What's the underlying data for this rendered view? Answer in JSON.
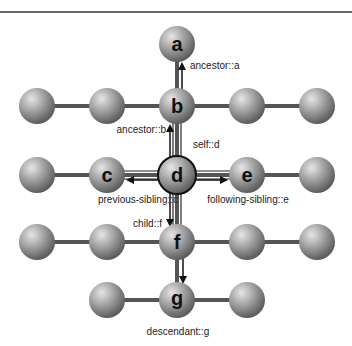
{
  "diagram": {
    "nodes": {
      "a": "a",
      "b": "b",
      "c": "c",
      "d": "d",
      "e": "e",
      "f": "f",
      "g": "g"
    },
    "axis_labels": {
      "ancestor_a": "ancestor::a",
      "ancestor_b": "ancestor::b",
      "self_d": "self::d",
      "previous_sibling_c": "previous-sibling::c",
      "following_sibling_e": "following-sibling::e",
      "child_f": "child::f",
      "descendant_g": "descendant::g"
    },
    "colors": {
      "sphere": "#9a9a9a",
      "connector": "#555555",
      "arrow": "#111111",
      "top_rule": "#333333"
    }
  }
}
